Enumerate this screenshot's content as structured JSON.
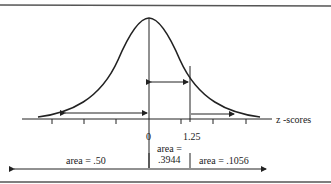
{
  "diagram": {
    "type": "normal-distribution",
    "axis_label": "z -scores",
    "ticks": [
      {
        "label": "0",
        "z": 0
      },
      {
        "label": "1.25",
        "z": 1.25
      }
    ],
    "regions": [
      {
        "name": "left-half",
        "label": "area = .50"
      },
      {
        "name": "middle",
        "label_line1": "area =",
        "label_line2": ".3944"
      },
      {
        "name": "right-tail",
        "label": "area = .1056"
      }
    ],
    "colors": {
      "ink": "#222222",
      "rule": "#555555",
      "background": "#ffffff"
    }
  }
}
